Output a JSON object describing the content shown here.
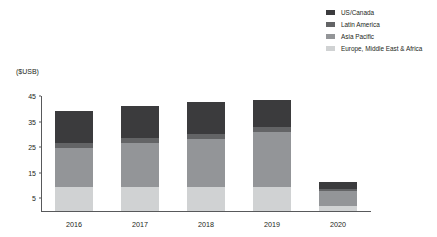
{
  "chart_data": {
    "type": "bar",
    "subtype": "stacked-vertical",
    "title": "",
    "xlabel": "",
    "ylabel": "($USB)",
    "ylim": [
      0,
      45
    ],
    "yticks": [
      5,
      15,
      25,
      35,
      45
    ],
    "grid": false,
    "legend_position": "top-right",
    "categories": [
      "2016",
      "2017",
      "2018",
      "2019",
      "2020"
    ],
    "stack_order_bottom_to_top": [
      "Europe, Middle East & Africa",
      "Asia Pacific",
      "Latin America",
      "US/Canada"
    ],
    "series": [
      {
        "name": "US/Canada",
        "color": "#3b3b3d",
        "values": [
          12.5,
          12.5,
          12.5,
          10.5,
          3.0
        ]
      },
      {
        "name": "Latin America",
        "color": "#636466",
        "values": [
          2.0,
          2.0,
          2.0,
          2.0,
          0.5
        ]
      },
      {
        "name": "Asia Pacific",
        "color": "#939598",
        "values": [
          15.0,
          17.0,
          18.5,
          21.5,
          6.0
        ]
      },
      {
        "name": "Europe, Middle East & Africa",
        "color": "#d0d2d3",
        "values": [
          9.5,
          9.5,
          9.5,
          9.5,
          2.0
        ]
      }
    ],
    "totals": [
      39.0,
      41.0,
      42.5,
      43.5,
      11.5
    ]
  },
  "legend": {
    "items": [
      {
        "label": "US/Canada",
        "color": "#3b3b3d"
      },
      {
        "label": "Latin America",
        "color": "#636466"
      },
      {
        "label": "Asia Pacific",
        "color": "#939598"
      },
      {
        "label": "Europe, Middle East & Africa",
        "color": "#d0d2d3"
      }
    ]
  },
  "axes": {
    "y_unit_caption": "($USB)",
    "y_tick_labels": [
      "45",
      "35",
      "25",
      "15",
      "5"
    ],
    "x_tick_labels": [
      "2016",
      "2017",
      "2018",
      "2019",
      "2020"
    ]
  },
  "style": {
    "axis_color": "#58595b",
    "text_color": "#231f20",
    "background": "#ffffff"
  }
}
